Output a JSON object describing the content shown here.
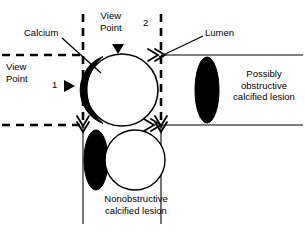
{
  "figure": {
    "type": "medical-cross-section-diagram",
    "background_color": "#ffffff",
    "stroke_color": "#000000",
    "calcium_fill": "#000000",
    "lumen_fill": "#ffffff"
  },
  "labels": {
    "calcium": "Calcium",
    "lumen": "Lumen",
    "view_point_2": "View\nPoint",
    "view_point_2_number": "2",
    "view_point_1": "View\nPoint",
    "view_point_1_number": "1",
    "possibly_obstructive": "Possibly\nobstructive\ncalcified lesion",
    "nonobstructive": "Nonobstructive\ncalcified lesion"
  },
  "geometry": {
    "vessel_upper_wall_y": 55,
    "vessel_lower_wall_y": 125,
    "left_dashed_vertical_x": 83,
    "right_dashed_vertical_x": 161,
    "main_lumen_circle": {
      "cx": 122,
      "cy": 90,
      "r": 36
    },
    "main_calcium_arc_side": "left",
    "right_calcified_ellipse": {
      "cx": 207,
      "cy": 90,
      "rx": 12,
      "ry": 33
    },
    "bottom_calcium_ellipse": {
      "cx": 96,
      "cy": 160,
      "rx": 12,
      "ry": 30
    },
    "bottom_lumen_circle": {
      "cx": 135,
      "cy": 160,
      "r": 30
    }
  },
  "markers": {
    "viewpoint2_arrow": "down-triangle",
    "viewpoint1_arrow": "right-triangle",
    "ray_arrow_top_right": "double-arrow-right",
    "ray_arrow_bottom_right": "double-arrow-right",
    "ray_arrow_bottom_left": "double-arrow-down",
    "ray_arrow_bottom_mid": "double-arrow-down"
  },
  "leader_lines": {
    "calcium_to_plaque": {
      "x1": 62,
      "y1": 38,
      "x2": 100,
      "y2": 72
    },
    "lumen_to_vessel": {
      "x1": 203,
      "y1": 36,
      "x2": 160,
      "y2": 57
    }
  }
}
